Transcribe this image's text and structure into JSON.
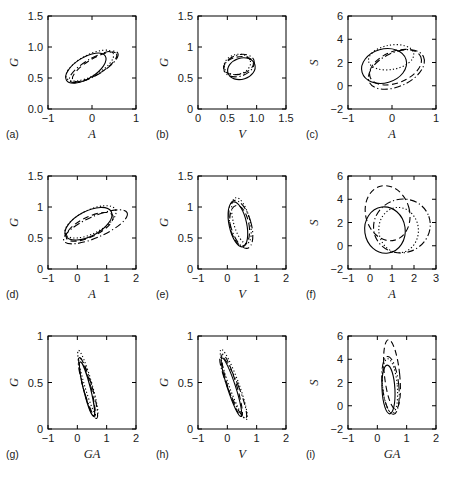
{
  "figure": {
    "title": "",
    "rows": 3,
    "cols": 3,
    "line_styles": [
      "solid",
      "dotted",
      "dashed",
      "dashdot"
    ],
    "stroke_color": "#000000",
    "background": "#ffffff"
  },
  "chart_data": {
    "type": "scatter",
    "title": "",
    "grid": false,
    "legend": null,
    "panels": [
      {
        "id": "a",
        "label": "(a)",
        "xlabel": "A",
        "ylabel": "G",
        "xlim": [
          -1,
          1
        ],
        "ylim": [
          0,
          1.5
        ],
        "xticks": [
          -1,
          0,
          1
        ],
        "xticklabels": [
          "-1",
          "0",
          "1"
        ],
        "yticks": [
          0,
          0.5,
          1.0,
          1.5
        ],
        "yticklabels": [
          "0.0",
          "0.5",
          "1.0",
          "1.5"
        ],
        "ellipses": [
          {
            "style": "solid",
            "cx": -0.14,
            "cy": 0.66,
            "rx": 0.52,
            "ry": 0.17,
            "angle": -32
          },
          {
            "style": "dotted",
            "cx": -0.05,
            "cy": 0.7,
            "rx": 0.6,
            "ry": 0.17,
            "angle": -28
          },
          {
            "style": "dashed",
            "cx": 0.06,
            "cy": 0.68,
            "rx": 0.58,
            "ry": 0.13,
            "angle": -31
          },
          {
            "style": "dashdot",
            "cx": 0.04,
            "cy": 0.68,
            "rx": 0.63,
            "ry": 0.14,
            "angle": -30
          }
        ]
      },
      {
        "id": "b",
        "label": "(b)",
        "xlabel": "V",
        "ylabel": "G",
        "xlim": [
          0,
          1.5
        ],
        "ylim": [
          0,
          1.5
        ],
        "xticks": [
          0,
          0.5,
          1.0,
          1.5
        ],
        "xticklabels": [
          "0",
          "0.5",
          "1.0",
          "1.5"
        ],
        "yticks": [
          0,
          0.5,
          1.0,
          1.5
        ],
        "yticklabels": [
          "0",
          "0.5",
          "1",
          "1.5"
        ],
        "ellipses": [
          {
            "style": "solid",
            "cx": 0.74,
            "cy": 0.65,
            "rx": 0.24,
            "ry": 0.17,
            "angle": -18
          },
          {
            "style": "dotted",
            "cx": 0.67,
            "cy": 0.72,
            "rx": 0.23,
            "ry": 0.16,
            "angle": -15
          },
          {
            "style": "dashed",
            "cx": 0.69,
            "cy": 0.7,
            "rx": 0.26,
            "ry": 0.14,
            "angle": -12
          },
          {
            "style": "dashdot",
            "cx": 0.7,
            "cy": 0.7,
            "rx": 0.27,
            "ry": 0.17,
            "angle": -20
          }
        ]
      },
      {
        "id": "c",
        "label": "(c)",
        "xlabel": "A",
        "ylabel": "S",
        "xlim": [
          -1,
          1
        ],
        "ylim": [
          -2,
          6
        ],
        "xticks": [
          -1,
          0,
          1
        ],
        "xticklabels": [
          "-1",
          "0",
          "1"
        ],
        "yticks": [
          -2,
          0,
          2,
          4,
          6
        ],
        "yticklabels": [
          "-2",
          "0",
          "2",
          "4",
          "6"
        ],
        "ellipses": [
          {
            "style": "solid",
            "cx": -0.18,
            "cy": 1.7,
            "rx": 0.52,
            "ry": 1.45,
            "angle": -16
          },
          {
            "style": "dotted",
            "cx": -0.02,
            "cy": 2.45,
            "rx": 0.52,
            "ry": 1.05,
            "angle": -10
          },
          {
            "style": "dashed",
            "cx": 0.08,
            "cy": 1.6,
            "rx": 0.62,
            "ry": 1.35,
            "angle": -22
          },
          {
            "style": "dashdot",
            "cx": 0.1,
            "cy": 1.4,
            "rx": 0.68,
            "ry": 1.45,
            "angle": -25
          }
        ]
      },
      {
        "id": "d",
        "label": "(d)",
        "xlabel": "A",
        "ylabel": "G",
        "xlim": [
          -1,
          2
        ],
        "ylim": [
          0,
          1.5
        ],
        "xticks": [
          -1,
          0,
          1,
          2
        ],
        "xticklabels": [
          "-1",
          "0",
          "1",
          "2"
        ],
        "yticks": [
          0,
          0.5,
          1.0,
          1.5
        ],
        "yticklabels": [
          "0",
          "0.5",
          "1",
          "1.5"
        ],
        "ellipses": [
          {
            "style": "solid",
            "cx": 0.38,
            "cy": 0.73,
            "rx": 0.88,
            "ry": 0.2,
            "angle": -28
          },
          {
            "style": "dotted",
            "cx": 0.45,
            "cy": 0.76,
            "rx": 0.95,
            "ry": 0.19,
            "angle": -26
          },
          {
            "style": "dashed",
            "cx": 0.42,
            "cy": 0.68,
            "rx": 0.88,
            "ry": 0.16,
            "angle": -26
          },
          {
            "style": "dashdot",
            "cx": 0.62,
            "cy": 0.68,
            "rx": 1.18,
            "ry": 0.17,
            "angle": -24
          }
        ]
      },
      {
        "id": "e",
        "label": "(e)",
        "xlabel": "V",
        "ylabel": "G",
        "xlim": [
          -1,
          2
        ],
        "ylim": [
          0,
          1.5
        ],
        "xticks": [
          -1,
          0,
          1,
          2
        ],
        "xticklabels": [
          "-1",
          "0",
          "1",
          "2"
        ],
        "yticks": [
          0,
          0.5,
          1.0,
          1.5
        ],
        "yticklabels": [
          "0",
          "0.5",
          "1",
          "1.5"
        ],
        "ellipses": [
          {
            "style": "solid",
            "cx": 0.36,
            "cy": 0.72,
            "rx": 0.3,
            "ry": 0.37,
            "angle": -12
          },
          {
            "style": "dotted",
            "cx": 0.48,
            "cy": 0.78,
            "rx": 0.28,
            "ry": 0.38,
            "angle": -14
          },
          {
            "style": "dashed",
            "cx": 0.42,
            "cy": 0.7,
            "rx": 0.32,
            "ry": 0.33,
            "angle": -10
          },
          {
            "style": "dashdot",
            "cx": 0.46,
            "cy": 0.72,
            "rx": 0.35,
            "ry": 0.4,
            "angle": -16
          }
        ]
      },
      {
        "id": "f",
        "label": "(f)",
        "xlabel": "A",
        "ylabel": "S",
        "xlim": [
          -1,
          3
        ],
        "ylim": [
          -2,
          6
        ],
        "xticks": [
          -1,
          0,
          1,
          2,
          3
        ],
        "xticklabels": [
          "-1",
          "0",
          "1",
          "2",
          "3"
        ],
        "yticks": [
          -2,
          0,
          2,
          4,
          6
        ],
        "yticklabels": [
          "-2",
          "0",
          "2",
          "4",
          "6"
        ],
        "ellipses": [
          {
            "style": "solid",
            "cx": 0.68,
            "cy": 1.35,
            "rx": 0.92,
            "ry": 2.0,
            "angle": -8
          },
          {
            "style": "dotted",
            "cx": 1.3,
            "cy": 1.35,
            "rx": 0.9,
            "ry": 1.95,
            "angle": -5
          },
          {
            "style": "dashed",
            "cx": 0.8,
            "cy": 2.8,
            "rx": 1.0,
            "ry": 2.4,
            "angle": -15
          },
          {
            "style": "dashdot",
            "cx": 1.45,
            "cy": 1.7,
            "rx": 1.3,
            "ry": 2.3,
            "angle": -20
          }
        ]
      },
      {
        "id": "g",
        "label": "(g)",
        "xlabel": "GA",
        "ylabel": "G",
        "xlim": [
          -1,
          2
        ],
        "ylim": [
          0,
          1
        ],
        "xticks": [
          -1,
          0,
          1,
          2
        ],
        "xticklabels": [
          "-1",
          "0",
          "1",
          "2"
        ],
        "yticks": [
          0,
          0.5,
          1
        ],
        "yticklabels": [
          "0",
          "0.5",
          "1"
        ],
        "ellipses": [
          {
            "style": "solid",
            "cx": 0.33,
            "cy": 0.43,
            "rx": 0.12,
            "ry": 0.3,
            "angle": -14
          },
          {
            "style": "dotted",
            "cx": 0.36,
            "cy": 0.49,
            "rx": 0.13,
            "ry": 0.37,
            "angle": -16
          },
          {
            "style": "dashed",
            "cx": 0.33,
            "cy": 0.45,
            "rx": 0.13,
            "ry": 0.33,
            "angle": -14
          },
          {
            "style": "dashdot",
            "cx": 0.36,
            "cy": 0.44,
            "rx": 0.15,
            "ry": 0.34,
            "angle": -16
          }
        ]
      },
      {
        "id": "h",
        "label": "(h)",
        "xlabel": "V",
        "ylabel": "G",
        "xlim": [
          -1,
          2
        ],
        "ylim": [
          0,
          1
        ],
        "xticks": [
          -1,
          0,
          1,
          2
        ],
        "xticklabels": [
          "-1",
          "0",
          "1",
          "2"
        ],
        "yticks": [
          0,
          0.5,
          1
        ],
        "yticklabels": [
          "0",
          "0.5",
          "1"
        ],
        "ellipses": [
          {
            "style": "solid",
            "cx": 0.14,
            "cy": 0.45,
            "rx": 0.14,
            "ry": 0.33,
            "angle": -18
          },
          {
            "style": "dotted",
            "cx": 0.22,
            "cy": 0.48,
            "rx": 0.17,
            "ry": 0.4,
            "angle": -20
          },
          {
            "style": "dashed",
            "cx": 0.16,
            "cy": 0.47,
            "rx": 0.15,
            "ry": 0.35,
            "angle": -17
          },
          {
            "style": "dashdot",
            "cx": 0.2,
            "cy": 0.45,
            "rx": 0.18,
            "ry": 0.36,
            "angle": -22
          }
        ]
      },
      {
        "id": "i",
        "label": "(i)",
        "xlabel": "GA",
        "ylabel": "S",
        "xlim": [
          -1,
          2
        ],
        "ylim": [
          -2,
          6
        ],
        "xticks": [
          -1,
          0,
          1,
          2
        ],
        "xticklabels": [
          "-1",
          "0",
          "1",
          "2"
        ],
        "yticks": [
          -2,
          0,
          2,
          4,
          6
        ],
        "yticklabels": [
          "-2",
          "0",
          "2",
          "4",
          "6"
        ],
        "ellipses": [
          {
            "style": "solid",
            "cx": 0.38,
            "cy": 1.4,
            "rx": 0.22,
            "ry": 2.1,
            "angle": -3
          },
          {
            "style": "dotted",
            "cx": 0.43,
            "cy": 1.7,
            "rx": 0.25,
            "ry": 2.35,
            "angle": -5
          },
          {
            "style": "dashed",
            "cx": 0.5,
            "cy": 2.7,
            "rx": 0.26,
            "ry": 3.0,
            "angle": -6
          },
          {
            "style": "dashdot",
            "cx": 0.45,
            "cy": 1.75,
            "rx": 0.28,
            "ry": 2.5,
            "angle": -6
          }
        ]
      }
    ]
  }
}
